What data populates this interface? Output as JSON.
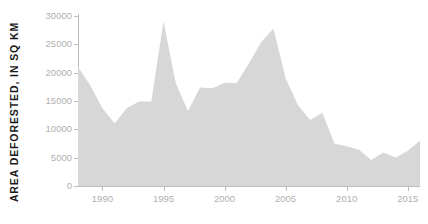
{
  "chart_data": {
    "type": "area",
    "title": "",
    "xlabel": "",
    "ylabel": "AREA DEFORESTED, IN SQ KM",
    "xlim": [
      1988,
      2016
    ],
    "ylim": [
      0,
      30000
    ],
    "grid": false,
    "legend": "none",
    "series_name": "Area deforested",
    "fill_color": "#d7d7d7",
    "axis_color": "#bdbdbd",
    "tick_label_color": "#b0b0b0",
    "background_color": "#ffffff",
    "x": [
      1988,
      1989,
      1990,
      1991,
      1992,
      1993,
      1994,
      1995,
      1996,
      1997,
      1998,
      1999,
      2000,
      2001,
      2002,
      2003,
      2004,
      2005,
      2006,
      2007,
      2008,
      2009,
      2010,
      2011,
      2012,
      2013,
      2014,
      2015,
      2016
    ],
    "values": [
      21050,
      17770,
      13730,
      11030,
      13786,
      14896,
      14896,
      29059,
      18161,
      13227,
      17383,
      17259,
      18226,
      18165,
      21651,
      25396,
      27772,
      19014,
      14286,
      11651,
      12911,
      7464,
      7000,
      6418,
      4571,
      5891,
      5012,
      6207,
      7989
    ],
    "yticks": [
      0,
      5000,
      10000,
      15000,
      20000,
      25000,
      30000
    ],
    "ytick_labels": [
      "0",
      "5000",
      "10000",
      "15000",
      "20000",
      "25000",
      "30000"
    ],
    "xticks": [
      1990,
      1995,
      2000,
      2005,
      2010,
      2015
    ],
    "xtick_labels": [
      "1990",
      "1995",
      "2000",
      "2005",
      "2010",
      "2015"
    ]
  }
}
